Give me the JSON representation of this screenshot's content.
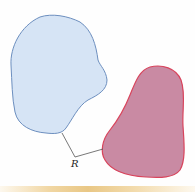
{
  "figure": {
    "label": "R",
    "colors": {
      "region_a_fill": "#d6e4f5",
      "region_a_stroke": "#6d8fbf",
      "region_b_fill": "#c98aa3",
      "region_b_stroke": "#d8445c",
      "connector": "#555555",
      "bottom_bar": "#e9c785"
    },
    "regions": [
      {
        "name": "blue-region"
      },
      {
        "name": "red-region"
      }
    ]
  }
}
